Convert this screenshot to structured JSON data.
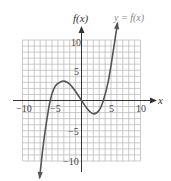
{
  "chart_data": {
    "type": "line",
    "title": "",
    "xlabel": "x",
    "ylabel": "f(x)",
    "curve_label": "y = f(x)",
    "xlim": [
      -10,
      10
    ],
    "ylim": [
      -10,
      10
    ],
    "grid": true,
    "grid_step": 1,
    "x_ticks": [
      {
        "value": -10,
        "label": "−10"
      },
      {
        "value": -5,
        "label": "−5"
      },
      {
        "value": 5,
        "label": "5"
      },
      {
        "value": 10,
        "label": "10"
      }
    ],
    "y_ticks": [
      {
        "value": 10,
        "label": "10"
      },
      {
        "value": 5,
        "label": "5"
      },
      {
        "value": -5,
        "label": "−5"
      },
      {
        "value": -10,
        "label": "−10"
      }
    ],
    "series": [
      {
        "name": "y = f(x)",
        "description": "cubic with roots near -5.3, 0, 3.7; local max ~(-2.9, 3.2); local min ~(2, -2.2); arrows at both ends",
        "x": [
          -7.1,
          -6.5,
          -6,
          -5.3,
          -4.5,
          -3.5,
          -2.9,
          -2,
          -1,
          0,
          1,
          2,
          3,
          3.7,
          4.5,
          5.2,
          6.1
        ],
        "y": [
          -12.8,
          -7.5,
          -4.0,
          0,
          2.3,
          3.1,
          3.2,
          2.7,
          1.5,
          0,
          -1.4,
          -2.2,
          -1.6,
          0,
          3.0,
          7.0,
          12.8
        ]
      }
    ],
    "colors": {
      "curve": "#555555",
      "grid": "#bdbdbd",
      "axis": "#333333"
    }
  }
}
